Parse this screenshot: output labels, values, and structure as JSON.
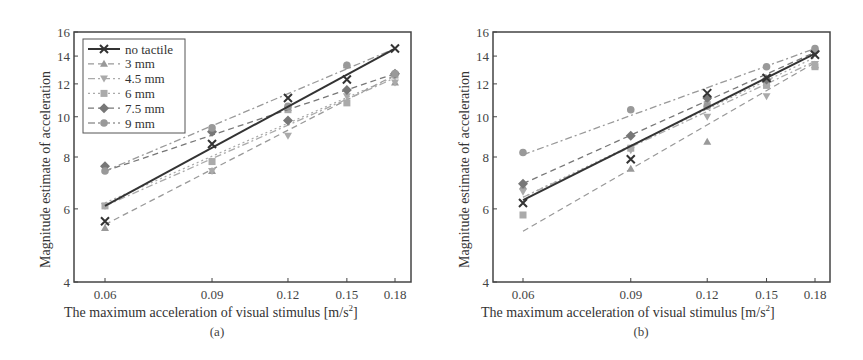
{
  "chart_data": [
    {
      "type": "line",
      "panel": "(a)",
      "xlabel": "The maximum acceleration of visual stimulus [m/s²]",
      "ylabel": "Magnitude estimate of acceleration",
      "x": [
        0.06,
        0.09,
        0.12,
        0.15,
        0.18
      ],
      "x_ticks": [
        "0.06",
        "0.09",
        "0.12",
        "0.15",
        "0.18"
      ],
      "y_ticks": [
        "4",
        "6",
        "8",
        "10",
        "12",
        "14",
        "16"
      ],
      "ylim": [
        4,
        16
      ],
      "xscale": "log",
      "yscale": "log",
      "grid": false,
      "legend_position": "upper left",
      "series": [
        {
          "name": "no tactile",
          "marker": "x",
          "style": "solid",
          "color": "#333333",
          "values": [
            5.6,
            8.6,
            11.1,
            12.3,
            14.6
          ],
          "fit": [
            6.1,
            14.6
          ]
        },
        {
          "name": "3 mm",
          "marker": "triangle-up",
          "style": "dashed",
          "color": "#999999",
          "values": [
            5.4,
            7.4,
            10.5,
            13.3,
            12.1
          ],
          "fit": [
            5.5,
            12.6
          ]
        },
        {
          "name": "4.5 mm",
          "marker": "triangle-down",
          "style": "dash-dot",
          "color": "#aaaaaa",
          "values": [
            6.1,
            7.4,
            9.0,
            11.2,
            12.1
          ],
          "fit": [
            6.1,
            12.4
          ]
        },
        {
          "name": "6 mm",
          "marker": "square",
          "style": "dotted",
          "color": "#aaaaaa",
          "values": [
            6.1,
            7.8,
            10.4,
            10.8,
            12.6
          ],
          "fit": [
            6.2,
            12.5
          ]
        },
        {
          "name": "7.5 mm",
          "marker": "diamond",
          "style": "dashed",
          "color": "#777777",
          "values": [
            7.6,
            9.2,
            9.8,
            11.6,
            12.7
          ],
          "fit": [
            7.4,
            12.7
          ]
        },
        {
          "name": "9 mm",
          "marker": "circle",
          "style": "dash-dot",
          "color": "#999999",
          "values": [
            7.4,
            9.4,
            10.6,
            13.3,
            12.7
          ],
          "fit": [
            7.4,
            14.6
          ]
        }
      ]
    },
    {
      "type": "line",
      "panel": "(b)",
      "xlabel": "The maximum acceleration of visual stimulus [m/s²]",
      "ylabel": "Magnitude estimate of acceleration",
      "x": [
        0.06,
        0.09,
        0.12,
        0.15,
        0.18
      ],
      "x_ticks": [
        "0.06",
        "0.09",
        "0.12",
        "0.15",
        "0.18"
      ],
      "y_ticks": [
        "4",
        "6",
        "8",
        "10",
        "12",
        "14",
        "16"
      ],
      "ylim": [
        4,
        16
      ],
      "xscale": "log",
      "yscale": "log",
      "grid": false,
      "legend_position": "none",
      "series": [
        {
          "name": "no tactile",
          "marker": "x",
          "style": "solid",
          "color": "#333333",
          "values": [
            6.2,
            7.9,
            11.4,
            12.4,
            14.1
          ],
          "fit": [
            6.3,
            14.2
          ]
        },
        {
          "name": "3 mm",
          "marker": "triangle-up",
          "style": "dashed",
          "color": "#999999",
          "values": [
            6.8,
            7.5,
            8.7,
            12.1,
            13.3
          ],
          "fit": [
            5.3,
            13.5
          ]
        },
        {
          "name": "4.5 mm",
          "marker": "triangle-down",
          "style": "dash-dot",
          "color": "#aaaaaa",
          "values": [
            6.6,
            8.3,
            10.0,
            11.2,
            13.4
          ],
          "fit": [
            6.4,
            13.6
          ]
        },
        {
          "name": "6 mm",
          "marker": "square",
          "style": "dotted",
          "color": "#aaaaaa",
          "values": [
            5.8,
            8.4,
            10.7,
            11.9,
            13.2
          ],
          "fit": [
            6.4,
            13.9
          ]
        },
        {
          "name": "7.5 mm",
          "marker": "diamond",
          "style": "dashed",
          "color": "#777777",
          "values": [
            6.9,
            9.0,
            11.1,
            12.3,
            14.4
          ],
          "fit": [
            6.9,
            14.3
          ]
        },
        {
          "name": "9 mm",
          "marker": "circle",
          "style": "dash-dot",
          "color": "#999999",
          "values": [
            8.2,
            10.4,
            10.6,
            13.2,
            14.6
          ],
          "fit": [
            8.1,
            14.6
          ]
        }
      ]
    }
  ],
  "panels": [
    {
      "caption": "(a)",
      "xlabel": "The maximum acceleration of visual stimulus [m/s",
      "xlabel_sup": "2",
      "xlabel_end": "]",
      "ylabel": "Magnitude estimate of acceleration"
    },
    {
      "caption": "(b)",
      "xlabel": "The maximum acceleration of visual stimulus [m/s",
      "xlabel_sup": "2",
      "xlabel_end": "]",
      "ylabel": "Magnitude estimate of acceleration"
    }
  ],
  "legend": {
    "items": [
      "no tactile",
      "3 mm",
      "4.5 mm",
      "6 mm",
      "7.5 mm",
      "9 mm"
    ]
  }
}
